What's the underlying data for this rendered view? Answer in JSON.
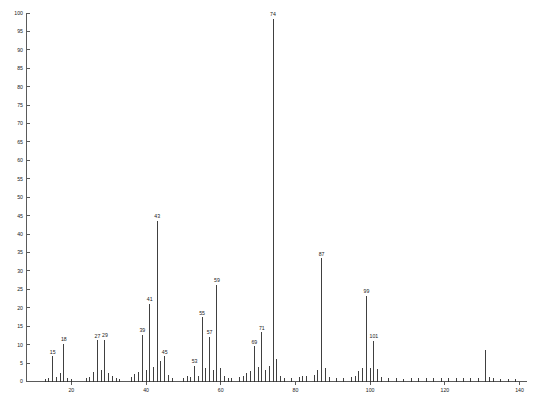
{
  "chart_data": {
    "type": "bar",
    "title": "",
    "subtitle": "",
    "xlabel": "",
    "ylabel": "",
    "xlim": [
      8,
      142
    ],
    "ylim": [
      0,
      100
    ],
    "grid": false,
    "legend": null,
    "x_ticks": [
      20,
      40,
      60,
      80,
      100,
      120,
      140
    ],
    "x_tick_labels": [
      "20",
      "40",
      "60",
      "80",
      "100",
      "120",
      "140"
    ],
    "y_ticks": [
      0,
      5,
      10,
      15,
      20,
      25,
      30,
      35,
      40,
      45,
      50,
      55,
      60,
      65,
      70,
      75,
      80,
      85,
      90,
      95,
      100
    ],
    "y_tick_labels": [
      "0",
      "5",
      "10",
      "15",
      "20",
      "25",
      "30",
      "35",
      "40",
      "45",
      "50",
      "55",
      "60",
      "65",
      "70",
      "75",
      "80",
      "85",
      "90",
      "95",
      "100"
    ],
    "x": [
      13,
      14,
      15,
      16,
      17,
      18,
      19,
      20,
      24,
      25,
      26,
      27,
      28,
      29,
      30,
      31,
      32,
      33,
      36,
      37,
      38,
      39,
      40,
      41,
      42,
      43,
      44,
      45,
      46,
      47,
      50,
      51,
      52,
      53,
      54,
      55,
      56,
      57,
      58,
      59,
      60,
      61,
      62,
      63,
      65,
      66,
      67,
      68,
      69,
      70,
      71,
      72,
      73,
      74,
      75,
      76,
      77,
      79,
      81,
      82,
      83,
      85,
      86,
      87,
      88,
      89,
      91,
      93,
      95,
      96,
      97,
      98,
      99,
      100,
      101,
      102,
      103,
      105,
      107,
      109,
      111,
      113,
      115,
      117,
      119,
      121,
      123,
      125,
      127,
      129,
      131,
      132,
      133,
      135,
      137,
      139
    ],
    "values": [
      0.8,
      1.0,
      6.8,
      1.2,
      2.4,
      10.3,
      1.0,
      0.6,
      0.9,
      1.1,
      2.6,
      11.2,
      3.2,
      11.3,
      2.4,
      1.4,
      0.9,
      0.7,
      1.2,
      2.1,
      2.6,
      12.7,
      3.0,
      21.1,
      4.0,
      43.6,
      5.5,
      6.8,
      1.8,
      1.0,
      1.0,
      1.5,
      1.2,
      4.3,
      1.5,
      17.4,
      3.6,
      12.2,
      3.2,
      26.2,
      3.6,
      1.6,
      0.9,
      1.0,
      1.2,
      1.6,
      2.3,
      2.8,
      9.5,
      3.8,
      13.3,
      3.0,
      4.3,
      98.5,
      6.0,
      1.6,
      1.0,
      1.0,
      1.3,
      1.5,
      1.4,
      1.8,
      3.2,
      33.4,
      3.6,
      1.2,
      1.0,
      0.9,
      1.1,
      1.6,
      2.8,
      3.6,
      23.3,
      3.6,
      11.0,
      3.4,
      1.3,
      0.9,
      1.0,
      0.8,
      0.9,
      1.0,
      1.0,
      1.0,
      1.0,
      1.0,
      1.0,
      1.0,
      1.0,
      1.0,
      8.5,
      1.3,
      0.9,
      0.8,
      0.8,
      0.8
    ],
    "labeled_peaks": [
      {
        "mz": 15,
        "intensity": 6.8,
        "label": "15"
      },
      {
        "mz": 18,
        "intensity": 10.3,
        "label": "18"
      },
      {
        "mz": 27,
        "intensity": 11.2,
        "label": "27"
      },
      {
        "mz": 29,
        "intensity": 11.3,
        "label": "29"
      },
      {
        "mz": 39,
        "intensity": 12.7,
        "label": "39"
      },
      {
        "mz": 41,
        "intensity": 21.1,
        "label": "41"
      },
      {
        "mz": 43,
        "intensity": 43.6,
        "label": "43"
      },
      {
        "mz": 45,
        "intensity": 6.8,
        "label": "45"
      },
      {
        "mz": 53,
        "intensity": 4.3,
        "label": "53"
      },
      {
        "mz": 55,
        "intensity": 17.4,
        "label": "55"
      },
      {
        "mz": 57,
        "intensity": 12.2,
        "label": "57"
      },
      {
        "mz": 59,
        "intensity": 26.2,
        "label": "59"
      },
      {
        "mz": 69,
        "intensity": 9.5,
        "label": "69"
      },
      {
        "mz": 71,
        "intensity": 13.3,
        "label": "71"
      },
      {
        "mz": 74,
        "intensity": 98.5,
        "label": "74"
      },
      {
        "mz": 87,
        "intensity": 33.4,
        "label": "87"
      },
      {
        "mz": 99,
        "intensity": 23.3,
        "label": "99"
      },
      {
        "mz": 101,
        "intensity": 11.0,
        "label": "101"
      }
    ],
    "base_peak_mz": 74,
    "base_peak_intensity": 100
  },
  "colors": {
    "peak": "#2b2b2b",
    "axis": "#5a5a5a",
    "text": "#1a1a1a",
    "background": "#ffffff",
    "footer": "#b9b9b9"
  },
  "footer": {
    "note": ""
  }
}
